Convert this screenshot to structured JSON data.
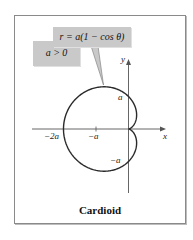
{
  "figure": {
    "title": "Cardioid",
    "equation": "r = a(1 − cos θ)",
    "condition": "a > 0",
    "axes": {
      "x_label": "x",
      "y_label": "y",
      "x_ticks": [
        "−2a",
        "−a"
      ],
      "y_ticks": [
        "a",
        "−a"
      ]
    },
    "colors": {
      "curve": "#2a2a2a",
      "axes": "#555555",
      "callout_bg": "#c9c9c9",
      "frame": "#8a8a8a"
    }
  }
}
